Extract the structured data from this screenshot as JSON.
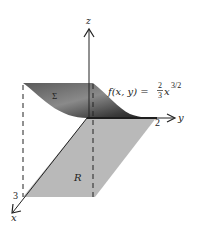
{
  "figure": {
    "axes": {
      "x_label": "x",
      "y_label": "y",
      "z_label": "z",
      "x_tick": "3",
      "y_tick": "2"
    },
    "surface": {
      "label": "Σ",
      "function_prefix": "f(x, y) = ",
      "coef_num": "2",
      "coef_den": "3",
      "var": "x",
      "exponent": "3/2"
    },
    "region": {
      "label": "R"
    },
    "colors": {
      "region_fill": "#b9b9b9",
      "surface_dark": "#3a3a3a",
      "surface_light": "#9a9a9a",
      "axis": "#222222"
    }
  }
}
